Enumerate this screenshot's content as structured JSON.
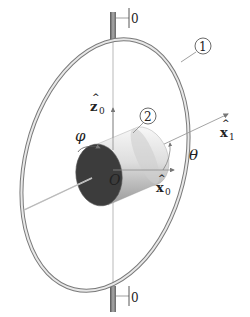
{
  "figure": {
    "type": "gimbal-rotor-diagram",
    "labels": {
      "top_fixed": "0",
      "bottom_fixed": "0",
      "ring_callout": "1",
      "rotor_callout": "2",
      "z0_base": "z",
      "z0_sub": "0",
      "x1_base": "x",
      "x1_sub": "1",
      "x0_base": "x",
      "x0_sub": "0",
      "hat": "^",
      "phi": "φ",
      "theta": "θ",
      "origin": "O"
    },
    "parts": [
      {
        "id": "0",
        "name": "fixed frame (top and bottom supports)"
      },
      {
        "id": "1",
        "name": "gimbal ring"
      },
      {
        "id": "2",
        "name": "rotor cylinder"
      }
    ],
    "axes": [
      {
        "name": "z0",
        "direction": "vertical"
      },
      {
        "name": "x0",
        "direction": "horizontal"
      },
      {
        "name": "x1",
        "direction": "inclined by theta from x0"
      }
    ],
    "angles": [
      {
        "symbol": "phi",
        "meaning": "rotor spin about x1"
      },
      {
        "symbol": "theta",
        "meaning": "angle between x0 and x1"
      }
    ],
    "colors": {
      "line": "#8a8a8a",
      "ring_light": "#e6e6e6",
      "ring_dark": "#7a7a7a",
      "rotor_face": "#3c3c3c",
      "rotor_body_light": "#f2f2f2",
      "rotor_body_dark": "#9a9a9a"
    }
  }
}
